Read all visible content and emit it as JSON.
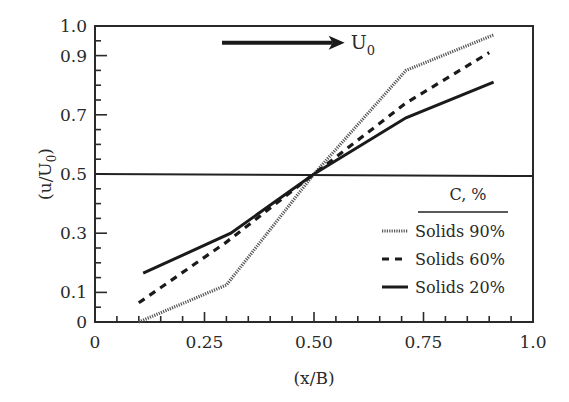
{
  "chart_data": {
    "type": "line",
    "title": "",
    "xlabel": "(x/B)",
    "ylabel": "(u/U0)",
    "ylabel_main": "(u/U",
    "ylabel_sub": "0",
    "ylabel_close": ")",
    "xlim": [
      0,
      1.0
    ],
    "ylim": [
      0,
      1.0
    ],
    "grid": false,
    "x_ticks": [
      {
        "value": 0,
        "label": "0"
      },
      {
        "value": 0.25,
        "label": "0.25"
      },
      {
        "value": 0.5,
        "label": "0.50"
      },
      {
        "value": 0.75,
        "label": "0.75"
      },
      {
        "value": 1.0,
        "label": "1.0"
      }
    ],
    "y_ticks": [
      {
        "value": 0,
        "label": "0"
      },
      {
        "value": 0.1,
        "label": "0.1"
      },
      {
        "value": 0.3,
        "label": "0.3"
      },
      {
        "value": 0.5,
        "label": "0.5"
      },
      {
        "value": 0.7,
        "label": "0.7"
      },
      {
        "value": 0.9,
        "label": "0.9"
      },
      {
        "value": 1.0,
        "label": "1.0"
      }
    ],
    "reference_line": {
      "y": 0.5,
      "x_range": [
        0,
        1.0
      ]
    },
    "annotation": {
      "text": "U",
      "sub": "0",
      "arrow": {
        "x_start": 0.29,
        "x_end": 0.57,
        "y": 0.943
      }
    },
    "legend": {
      "title": "C, %",
      "position": "lower right"
    },
    "series": [
      {
        "name": "Solids 90%",
        "style": "dotted",
        "x": [
          0.1,
          0.3,
          0.5,
          0.71,
          0.91
        ],
        "y": [
          0.0,
          0.125,
          0.5,
          0.85,
          0.97
        ]
      },
      {
        "name": "Solids 60%",
        "style": "dashed",
        "x": [
          0.1,
          0.3,
          0.5,
          0.71,
          0.9
        ],
        "y": [
          0.065,
          0.27,
          0.5,
          0.74,
          0.91
        ]
      },
      {
        "name": "Solids 20%",
        "style": "solid",
        "x": [
          0.11,
          0.31,
          0.5,
          0.71,
          0.91
        ],
        "y": [
          0.165,
          0.3,
          0.5,
          0.69,
          0.81
        ]
      }
    ]
  }
}
